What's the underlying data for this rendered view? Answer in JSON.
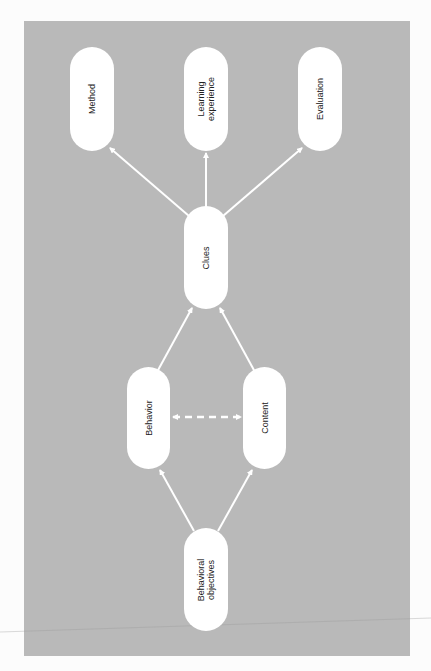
{
  "diagram": {
    "title": "",
    "background_color": "#b9b9b9",
    "node_color": "#ffffff",
    "edge_color": "#ffffff",
    "nodes": [
      {
        "id": "method",
        "lines": [
          "Method"
        ]
      },
      {
        "id": "learning_experience",
        "lines": [
          "Learning",
          "experience"
        ]
      },
      {
        "id": "evaluation",
        "lines": [
          "Evaluation"
        ]
      },
      {
        "id": "clues",
        "lines": [
          "Clues"
        ]
      },
      {
        "id": "behavior",
        "lines": [
          "Behavior"
        ]
      },
      {
        "id": "content",
        "lines": [
          "Content"
        ]
      },
      {
        "id": "behavioral_objectives",
        "lines": [
          "Behavioral",
          "objectives"
        ]
      }
    ],
    "edges": [
      {
        "from": "behavioral_objectives",
        "to": "behavior",
        "style": "solid",
        "arrow": "end"
      },
      {
        "from": "behavioral_objectives",
        "to": "content",
        "style": "solid",
        "arrow": "end"
      },
      {
        "from": "behavior",
        "to": "content",
        "style": "dashed",
        "arrow": "both"
      },
      {
        "from": "behavior",
        "to": "clues",
        "style": "solid",
        "arrow": "end"
      },
      {
        "from": "content",
        "to": "clues",
        "style": "solid",
        "arrow": "end"
      },
      {
        "from": "clues",
        "to": "method",
        "style": "solid",
        "arrow": "end"
      },
      {
        "from": "clues",
        "to": "learning_experience",
        "style": "solid",
        "arrow": "end"
      },
      {
        "from": "clues",
        "to": "evaluation",
        "style": "solid",
        "arrow": "end"
      }
    ]
  }
}
